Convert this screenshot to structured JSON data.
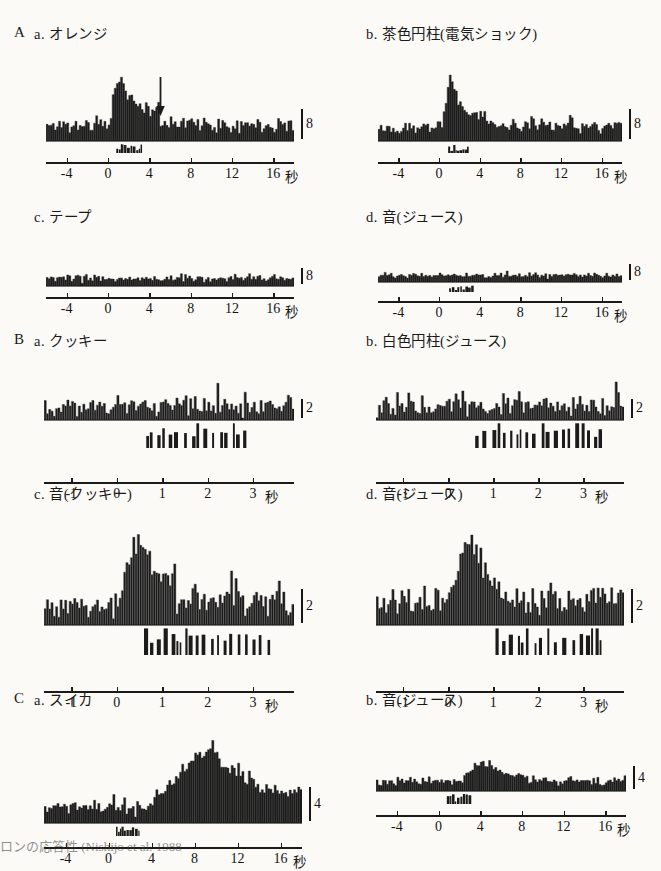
{
  "figure": {
    "background_color": "#fbfaf7",
    "ink_color": "#1b1b1b",
    "caption_fragment": "ロンの応答性 (Nishijo et al. 1988"
  },
  "groups": [
    {
      "letter": "A"
    },
    {
      "letter": "B"
    },
    {
      "letter": "C"
    }
  ],
  "panels": [
    {
      "id": "A-a",
      "group": "A",
      "label": "a. オレンジ",
      "scale_value": "8",
      "unit": "秒",
      "ticks": [
        "-4",
        "0",
        "4",
        "8",
        "12",
        "16"
      ],
      "has_arrow": true,
      "arrow_time": 5.0
    },
    {
      "id": "A-b",
      "group": "A",
      "label": "b. 茶色円柱(電気ショック)",
      "scale_value": "8",
      "unit": "秒",
      "ticks": [
        "-4",
        "0",
        "4",
        "8",
        "12",
        "16"
      ],
      "has_arrow": false
    },
    {
      "id": "A-c",
      "group": "A",
      "label": "c. テープ",
      "scale_value": "8",
      "unit": "秒",
      "ticks": [
        "-4",
        "0",
        "4",
        "8",
        "12",
        "16"
      ],
      "has_arrow": false
    },
    {
      "id": "A-d",
      "group": "A",
      "label": "d. 音(ジュース)",
      "scale_value": "8",
      "unit": "秒",
      "ticks": [
        "-4",
        "0",
        "4",
        "8",
        "12",
        "16"
      ],
      "has_arrow": false
    },
    {
      "id": "B-a",
      "group": "B",
      "label": "a. クッキー",
      "scale_value": "2",
      "unit": "秒",
      "ticks": [
        "-1",
        "0",
        "1",
        "2",
        "3"
      ],
      "has_arrow": false
    },
    {
      "id": "B-b",
      "group": "B",
      "label": "b. 白色円柱(ジュース)",
      "scale_value": "2",
      "unit": "秒",
      "ticks": [
        "-1",
        "0",
        "1",
        "2",
        "3"
      ],
      "has_arrow": false
    },
    {
      "id": "B-c",
      "group": "B",
      "label": "c. 音(クッキー)",
      "scale_value": "2",
      "unit": "秒",
      "ticks": [
        "-1",
        "0",
        "1",
        "2",
        "3"
      ],
      "has_arrow": false
    },
    {
      "id": "B-d",
      "group": "B",
      "label": "d. 音(ジュース)",
      "scale_value": "2",
      "unit": "秒",
      "ticks": [
        "-1",
        "0",
        "1",
        "2",
        "3"
      ],
      "has_arrow": false
    },
    {
      "id": "C-a",
      "group": "C",
      "label": "a. スイカ",
      "scale_value": "4",
      "unit": "秒",
      "ticks": [
        "-4",
        "0",
        "4",
        "8",
        "12",
        "16"
      ],
      "has_arrow": false
    },
    {
      "id": "C-b",
      "group": "C",
      "label": "b. 音(ジュース)",
      "scale_value": "4",
      "unit": "秒",
      "ticks": [
        "-4",
        "0",
        "4",
        "8",
        "12",
        "16"
      ],
      "has_arrow": false
    }
  ],
  "chart_data": [
    {
      "id": "A-a",
      "type": "bar",
      "title": "A a. オレンジ",
      "xlabel": "秒",
      "ylabel": "",
      "xlim": [
        -6,
        18
      ],
      "ylim": [
        0,
        30
      ],
      "scale_bar": 8,
      "tick_values": [
        -4,
        0,
        4,
        8,
        12,
        16
      ],
      "bin_width": 0.2,
      "baseline_level": 6.5,
      "noise_amplitude": 2.6,
      "response": {
        "onset": 0.2,
        "peak_time": 1.0,
        "peak_value": 27,
        "decay_end": 5.0,
        "plateau_value": 11
      },
      "annotation": {
        "type": "arrow",
        "time": 5.0,
        "direction": "down"
      },
      "event_trace": {
        "start": 0.8,
        "end": 3.2,
        "height": 3
      }
    },
    {
      "id": "A-b",
      "type": "bar",
      "title": "b. 茶色円柱(電気ショック)",
      "xlabel": "秒",
      "xlim": [
        -6,
        18
      ],
      "ylim": [
        0,
        30
      ],
      "scale_bar": 8,
      "tick_values": [
        -4,
        0,
        4,
        8,
        12,
        16
      ],
      "bin_width": 0.2,
      "baseline_level": 6,
      "noise_amplitude": 2.4,
      "response": {
        "onset": 0.4,
        "peak_time": 1.1,
        "peak_value": 26,
        "decay_end": 4.5,
        "plateau_value": 8
      },
      "event_trace": {
        "start": 0.9,
        "end": 3.0,
        "height": 3
      }
    },
    {
      "id": "A-c",
      "type": "bar",
      "title": "c. テープ",
      "xlabel": "秒",
      "xlim": [
        -6,
        18
      ],
      "ylim": [
        0,
        30
      ],
      "scale_bar": 8,
      "tick_values": [
        -4,
        0,
        4,
        8,
        12,
        16
      ],
      "bin_width": 0.2,
      "baseline_level": 6,
      "noise_amplitude": 2.4,
      "response": null,
      "event_trace": null
    },
    {
      "id": "A-d",
      "type": "bar",
      "title": "d. 音(ジュース)",
      "xlabel": "秒",
      "xlim": [
        -6,
        18
      ],
      "ylim": [
        0,
        30
      ],
      "scale_bar": 8,
      "tick_values": [
        -4,
        0,
        4,
        8,
        12,
        16
      ],
      "bin_width": 0.2,
      "baseline_level": 6,
      "noise_amplitude": 2.3,
      "response": null,
      "event_trace": {
        "start": 1.0,
        "end": 3.4,
        "height": 3
      }
    },
    {
      "id": "B-a",
      "type": "bar",
      "title": "B a. クッキー",
      "xlabel": "秒",
      "xlim": [
        -1.6,
        3.9
      ],
      "ylim": [
        0,
        10
      ],
      "scale_bar": 2,
      "tick_values": [
        -1,
        0,
        1,
        2,
        3
      ],
      "bin_width": 0.05,
      "baseline_level": 3.0,
      "noise_amplitude": 2.0,
      "response": null,
      "event_trace": {
        "start": 0.65,
        "end": 2.95,
        "height": 9,
        "style": "licks"
      }
    },
    {
      "id": "B-b",
      "type": "bar",
      "title": "b. 白色円柱(ジュース)",
      "xlabel": "秒",
      "xlim": [
        -1.6,
        3.9
      ],
      "ylim": [
        0,
        10
      ],
      "scale_bar": 2,
      "tick_values": [
        -1,
        0,
        1,
        2,
        3
      ],
      "bin_width": 0.05,
      "baseline_level": 3.2,
      "noise_amplitude": 2.1,
      "response": null,
      "event_trace": {
        "start": 0.6,
        "end": 3.5,
        "height": 9,
        "style": "licks"
      }
    },
    {
      "id": "B-c",
      "type": "bar",
      "title": "c. 音(クッキー)",
      "xlabel": "秒",
      "xlim": [
        -1.6,
        3.9
      ],
      "ylim": [
        0,
        12
      ],
      "scale_bar": 2,
      "tick_values": [
        -1,
        0,
        1,
        2,
        3
      ],
      "bin_width": 0.05,
      "baseline_level": 2.6,
      "noise_amplitude": 1.5,
      "response": {
        "onset": 0.05,
        "peak_time": 0.55,
        "peak_value": 11,
        "decay_end": 1.3,
        "plateau_value": 4.5
      },
      "event_trace": {
        "start": 0.6,
        "end": 3.5,
        "height": 9,
        "style": "licks"
      }
    },
    {
      "id": "B-d",
      "type": "bar",
      "title": "d. 音(ジュース)",
      "xlabel": "秒",
      "xlim": [
        -1.6,
        3.9
      ],
      "ylim": [
        0,
        12
      ],
      "scale_bar": 2,
      "tick_values": [
        -1,
        0,
        1,
        2,
        3
      ],
      "bin_width": 0.05,
      "baseline_level": 2.8,
      "noise_amplitude": 1.5,
      "response": {
        "onset": 0.05,
        "peak_time": 0.5,
        "peak_value": 11.5,
        "decay_end": 1.2,
        "plateau_value": 4.2
      },
      "event_trace": {
        "start": 1.05,
        "end": 3.5,
        "height": 9,
        "style": "licks"
      }
    },
    {
      "id": "C-a",
      "type": "bar",
      "title": "C a. スイカ",
      "xlabel": "秒",
      "xlim": [
        -6,
        18
      ],
      "ylim": [
        0,
        30
      ],
      "scale_bar": 4,
      "tick_values": [
        -4,
        0,
        4,
        8,
        12,
        16
      ],
      "bin_width": 0.2,
      "baseline_level": 5.5,
      "noise_amplitude": 2.2,
      "response": {
        "onset": 4.0,
        "peak_time": 9.5,
        "peak_value": 26,
        "decay_end": 18.0,
        "plateau_value": 9
      },
      "event_trace": {
        "start": 0.7,
        "end": 2.9,
        "height": 4
      }
    },
    {
      "id": "C-b",
      "type": "bar",
      "title": "b. 音(ジュース)",
      "xlabel": "秒",
      "xlim": [
        -6,
        18
      ],
      "ylim": [
        0,
        30
      ],
      "scale_bar": 4,
      "tick_values": [
        -4,
        0,
        4,
        8,
        12,
        16
      ],
      "bin_width": 0.2,
      "baseline_level": 5.5,
      "noise_amplitude": 2.0,
      "response": {
        "onset": 2.4,
        "peak_time": 4.2,
        "peak_value": 17,
        "decay_end": 8.5,
        "plateau_value": 7
      },
      "event_trace": {
        "start": 0.8,
        "end": 2.9,
        "height": 4
      }
    }
  ]
}
